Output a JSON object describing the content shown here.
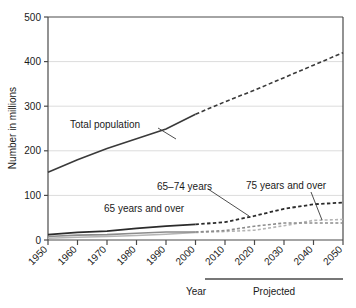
{
  "chart_data": {
    "type": "line",
    "title": "",
    "xlabel": "Year",
    "ylabel": "Number in millions",
    "ylim": [
      0,
      500
    ],
    "xlim": [
      1950,
      2050
    ],
    "grid": "horizontal",
    "legend": "inline-annotations",
    "x": [
      1950,
      1960,
      1970,
      1980,
      1990,
      2000,
      2010,
      2020,
      2030,
      2040,
      2050
    ],
    "y_ticks": [
      "0",
      "100",
      "200",
      "300",
      "400",
      "500"
    ],
    "x_ticks": [
      "1950",
      "1960",
      "1970",
      "1980",
      "1990",
      "2000",
      "2010",
      "2020",
      "2030",
      "2040",
      "2050"
    ],
    "projection_start_year": 2000,
    "series": [
      {
        "name": "Total population",
        "style": "solid-then-dashed",
        "color": "#3a3a3a",
        "values": [
          152,
          180,
          205,
          227,
          249,
          282,
          310,
          336,
          364,
          392,
          420
        ]
      },
      {
        "name": "65 years and over",
        "style": "solid-then-dashed",
        "color": "#2b2b2b",
        "values": [
          12,
          17,
          20,
          26,
          31,
          35,
          40,
          54,
          70,
          80,
          84
        ]
      },
      {
        "name": "65–74 years",
        "style": "solid-then-dashed",
        "color": "#8c8c8c",
        "values": [
          8,
          11,
          12,
          15,
          18,
          18,
          21,
          31,
          38,
          38,
          38
        ]
      },
      {
        "name": "75 years and over",
        "style": "solid-then-dashed",
        "color": "#b5b5b5",
        "values": [
          4,
          6,
          8,
          10,
          13,
          17,
          19,
          22,
          32,
          44,
          46
        ]
      }
    ],
    "annotations": [
      {
        "text": "Total population",
        "x": 1962,
        "y": 265
      },
      {
        "text": "65–74 years",
        "x": 1988,
        "y": 120
      },
      {
        "text": "65 years and over",
        "x": 1972,
        "y": 68
      },
      {
        "text": "75 years and over",
        "x": 2027,
        "y": 128
      }
    ],
    "brackets": [
      {
        "label": "Projected",
        "from_year": 2005,
        "to_year": 2050
      }
    ]
  },
  "axes": {
    "y_label": "Number in millions",
    "x_label": "Year",
    "y_ticks": [
      "500",
      "400",
      "300",
      "200",
      "100",
      "0"
    ],
    "x_ticks": [
      "1950",
      "1960",
      "1970",
      "1980",
      "1990",
      "2000",
      "2010",
      "2020",
      "2030",
      "2040",
      "2050"
    ]
  },
  "labels": {
    "total_population": "Total population",
    "age_65_74": "65–74 years",
    "age_65_over": "65 years and over",
    "age_75_over": "75 years and over",
    "projected": "Projected",
    "year": "Year"
  },
  "colors": {
    "axis": "#4a4a4a",
    "grid": "#dcdcdc",
    "total": "#3a3a3a",
    "over65": "#2b2b2b",
    "band6574": "#8c8c8c",
    "over75": "#b5b5b5",
    "text": "#1a1a1a"
  }
}
